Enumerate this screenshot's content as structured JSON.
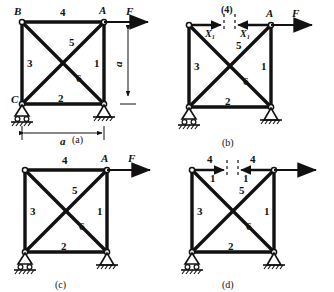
{
  "figure": {
    "panels": [
      {
        "id": "a",
        "caption": "(a)",
        "nodes": {
          "top_left": "B",
          "top_right": "A",
          "bottom_left": "C"
        },
        "members": {
          "right_vertical": "1",
          "bottom": "2",
          "left_vertical": "3",
          "top": "4",
          "diagonal_up": "5",
          "diagonal_down": "6"
        },
        "load": "F",
        "dim_horizontal": "a",
        "dim_vertical": "a",
        "support_left": "roller",
        "support_right": "pin"
      },
      {
        "id": "b",
        "caption": "(b)",
        "nodes": {
          "top_right": "A"
        },
        "members": {
          "right_vertical": "1",
          "bottom": "2",
          "left_vertical": "3",
          "top": "(4)",
          "diagonal_up": "5",
          "diagonal_down": "6"
        },
        "load": "F",
        "cut_label": "(4)",
        "redundant_left": "X₁",
        "redundant_right": "X₁",
        "support_left": "roller",
        "support_right": "pin"
      },
      {
        "id": "c",
        "caption": "(c)",
        "nodes": {
          "top_right": "A"
        },
        "members": {
          "right_vertical": "1",
          "bottom": "2",
          "left_vertical": "3",
          "top": "4",
          "diagonal_up": "5",
          "diagonal_down": "6"
        },
        "load": "F",
        "support_left": "roller",
        "support_right": "pin"
      },
      {
        "id": "d",
        "caption": "(d)",
        "members": {
          "right_vertical": "1",
          "bottom": "2",
          "left_vertical": "3",
          "diagonal_up": "5",
          "diagonal_down": "6"
        },
        "cut_left_top": "4",
        "cut_left_bottom": "1",
        "cut_right_top": "4",
        "cut_right_bottom": "1",
        "support_left": "roller",
        "support_right": "pin"
      }
    ],
    "colors": {
      "line": "#111111",
      "text": "#111111",
      "background": "#ffffff"
    }
  }
}
